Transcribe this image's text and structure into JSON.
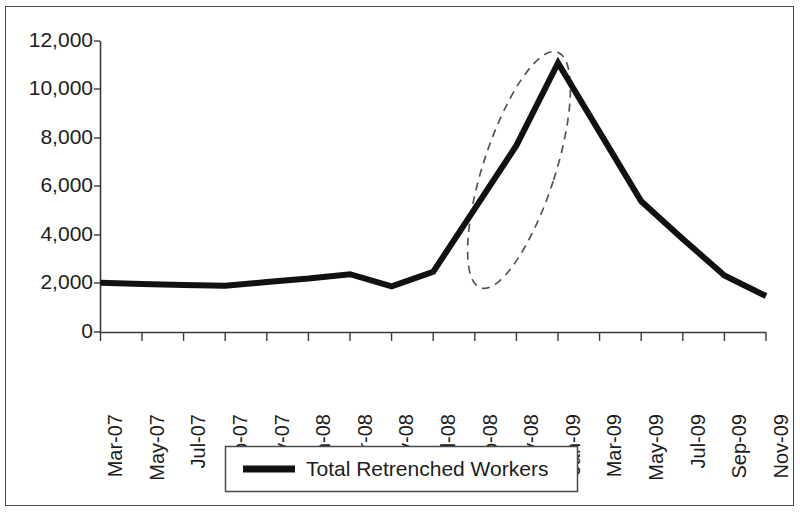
{
  "chart_data": {
    "type": "line",
    "title": "",
    "subtitle": "",
    "xlabel": "",
    "ylabel": "",
    "grid": false,
    "legend_position": "bottom",
    "ylim": [
      0,
      12000
    ],
    "ytick_labels": [
      "12,000",
      "10,000",
      "8,000",
      "6,000",
      "4,000",
      "2,000",
      "0"
    ],
    "ytick_values": [
      12000,
      10000,
      8000,
      6000,
      4000,
      2000,
      0
    ],
    "xtick_labels": [
      "Mar-07",
      "May-07",
      "Jul-07",
      "Sep-07",
      "Nov-07",
      "Jan-08",
      "Mar-08",
      "May-08",
      "Jul-08",
      "Sep-08",
      "Nov-08",
      "Jan-09",
      "Mar-09",
      "May-09",
      "Jul-09",
      "Sep-09",
      "Nov-09"
    ],
    "categories": [
      "Mar-07",
      "May-07",
      "Jul-07",
      "Sep-07",
      "Nov-07",
      "Jan-08",
      "Mar-08",
      "May-08",
      "Jul-08",
      "Sep-08",
      "Nov-08",
      "Jan-09",
      "Mar-09",
      "May-09",
      "Jul-09",
      "Sep-09",
      "Nov-09"
    ],
    "series": [
      {
        "name": "Total Retrenched Workers",
        "color": "#111111",
        "values": [
          2050,
          2000,
          1960,
          1920,
          2080,
          2220,
          2400,
          1900,
          2500,
          5100,
          7700,
          11100,
          8250,
          5400,
          3850,
          2350,
          1500
        ]
      }
    ],
    "annotations": [
      {
        "kind": "ellipse",
        "style": "dashed",
        "label": "",
        "highlights": "steep rise from Jul-08 to Jan-09 peak"
      }
    ]
  },
  "legend": {
    "entries": [
      {
        "label": "Total Retrenched Workers",
        "color": "#111111"
      }
    ]
  },
  "colors": {
    "series_line": "#111111",
    "axis": "#3a3a3a",
    "annotation": "#555555",
    "frame": "#4a4a4a",
    "background": "#ffffff"
  }
}
